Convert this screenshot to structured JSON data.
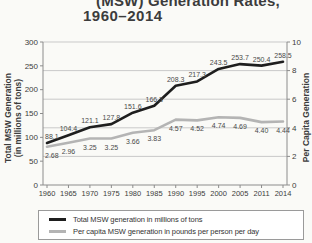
{
  "title": {
    "line1": "(MSW) Generation Rates,",
    "line2": "1960–2014"
  },
  "axis_titles": {
    "left_line1": "Total MSW Generation",
    "left_line2": "(in millions of tons)",
    "right": "Per Capita Generation"
  },
  "legend": {
    "items": [
      {
        "label": "Total MSW generation in millions of tons",
        "color": "#1e1e1e"
      },
      {
        "label": "Per capita MSW generation in pounds per person per day",
        "color": "#b4b4b4"
      }
    ]
  },
  "colors": {
    "total_line": "#1e1e1e",
    "per_capita_line": "#b4b4b4",
    "grid": "#c9c9c9",
    "axis": "#8c8c8c",
    "tick_text": "#3c3c3c",
    "data_label_text": "#4a4a4a",
    "background": "#fafaf7"
  },
  "chart_data": {
    "type": "line",
    "title": "(MSW) Generation Rates, 1960–2014",
    "categories": [
      "1960",
      "1965",
      "1970",
      "1975",
      "1980",
      "1985",
      "1990",
      "1995",
      "2000",
      "2005",
      "2011",
      "2014"
    ],
    "series": [
      {
        "name": "Total MSW generation in millions of tons",
        "axis": "left",
        "label_side": "above",
        "color": "#1e1e1e",
        "values": [
          88.1,
          104.4,
          121.1,
          127.8,
          151.6,
          166.3,
          208.3,
          217.3,
          243.5,
          253.7,
          250.4,
          258.5
        ],
        "point_labels": [
          "88.1",
          "104.4",
          "121.1",
          "127.8",
          "151.6",
          "166.3",
          "208.3",
          "217.3",
          "243.5",
          "253.7",
          "250.4",
          "258.5"
        ]
      },
      {
        "name": "Per capita MSW generation in pounds per person per day",
        "axis": "right",
        "label_side": "below",
        "color": "#b4b4b4",
        "values": [
          2.68,
          2.96,
          3.25,
          3.25,
          3.66,
          3.83,
          4.57,
          4.52,
          4.74,
          4.69,
          4.4,
          4.44
        ],
        "point_labels": [
          "2.68",
          "2.96",
          "3.25",
          "3.25",
          "3.66",
          "3.83",
          "4.57",
          "4.52",
          "4.74",
          "4.69",
          "4.40",
          "4.44"
        ]
      }
    ],
    "left_axis": {
      "label": "Total MSW Generation (in millions of tons)",
      "range": [
        0,
        300
      ],
      "ticks": [
        300,
        250,
        200,
        150,
        100,
        50,
        0
      ]
    },
    "right_axis": {
      "label": "Per Capita Generation",
      "range": [
        0,
        10
      ],
      "ticks": [
        10,
        8,
        6,
        4,
        2,
        0
      ]
    },
    "grid": "horizontal gridlines at right-axis ticks (2,4,6,8,10)",
    "legend_position": "bottom"
  }
}
